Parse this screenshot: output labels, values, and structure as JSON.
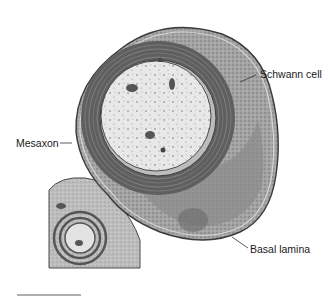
{
  "figure": {
    "labels": {
      "schwann_cell": "Schwann cell",
      "mesaxon": "Mesaxon",
      "basal_lamina": "Basal lamina"
    },
    "colors": {
      "background": "#ffffff",
      "myelin": "#6a6a6a",
      "axoplasm": "#e6e6e6",
      "cytoplasm": "#9a9a9a",
      "nucleus": "#7d7d7d",
      "outline": "#3a3a3a",
      "scale_bar": "#b0b0b0"
    }
  }
}
